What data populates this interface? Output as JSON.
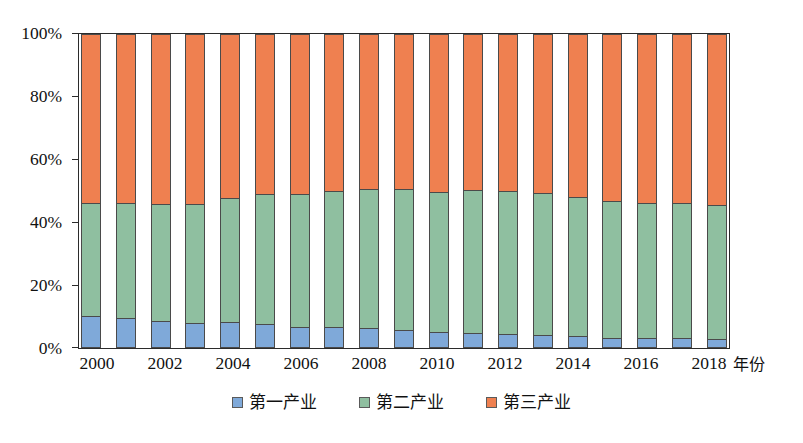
{
  "chart_data": {
    "type": "bar",
    "subtype": "stacked-percentage",
    "title": "",
    "xlabel": "年份",
    "ylabel": "",
    "ylim": [
      0,
      100
    ],
    "ytick_labels": [
      "0%",
      "20%",
      "40%",
      "60%",
      "80%",
      "100%"
    ],
    "ytick_values": [
      0,
      20,
      40,
      60,
      80,
      100
    ],
    "grid": false,
    "legend_position": "bottom-center",
    "categories": [
      "2000",
      "2001",
      "2002",
      "2003",
      "2004",
      "2005",
      "2006",
      "2007",
      "2008",
      "2009",
      "2010",
      "2011",
      "2012",
      "2013",
      "2014",
      "2015",
      "2016",
      "2017",
      "2018"
    ],
    "xtick_labels": [
      "2000",
      "2002",
      "2004",
      "2006",
      "2008",
      "2010",
      "2012",
      "2014",
      "2016",
      "2018"
    ],
    "series": [
      {
        "name": "第一产业",
        "color": "#7fa9d9",
        "values": [
          10.2,
          9.4,
          8.7,
          8.0,
          8.2,
          7.5,
          6.8,
          6.6,
          6.4,
          5.7,
          5.2,
          4.8,
          4.5,
          4.2,
          3.8,
          3.3,
          3.2,
          3.3,
          3.0
        ]
      },
      {
        "name": "第二产业",
        "color": "#8fbfa0",
        "values": [
          36.0,
          36.8,
          37.3,
          38.0,
          39.6,
          41.4,
          42.4,
          43.4,
          44.2,
          44.8,
          44.6,
          45.4,
          45.6,
          45.2,
          44.4,
          43.4,
          42.9,
          42.9,
          42.4
        ]
      },
      {
        "name": "第三产业",
        "color": "#ef8050",
        "values": [
          53.8,
          53.8,
          54.0,
          54.0,
          52.2,
          51.1,
          50.8,
          50.0,
          49.4,
          49.5,
          50.2,
          49.8,
          49.9,
          50.6,
          51.8,
          53.3,
          53.9,
          53.8,
          54.6
        ]
      }
    ]
  },
  "legend": {
    "items": [
      {
        "label": "第一产业",
        "color": "#7fa9d9",
        "marker": "square-swatch"
      },
      {
        "label": "第二产业",
        "color": "#8fbfa0",
        "marker": "square-swatch"
      },
      {
        "label": "第三产业",
        "color": "#ef8050",
        "marker": "square-swatch"
      }
    ]
  },
  "axes": {
    "x_axis_title": "年份",
    "y_axis_title": ""
  }
}
